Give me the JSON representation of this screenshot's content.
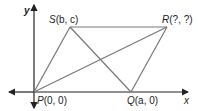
{
  "diagram": {
    "type": "coordinate-geometry-parallelogram",
    "axes": {
      "x_label": "x",
      "y_label": "y"
    },
    "points": [
      {
        "id": "P",
        "label": "P(0, 0)",
        "name": "P",
        "coords": "(0, 0)"
      },
      {
        "id": "Q",
        "label": "Q(a, 0)",
        "name": "Q",
        "coords": "(a, 0)"
      },
      {
        "id": "R",
        "label": "R(?, ?)",
        "name": "R",
        "coords": "(?, ?)"
      },
      {
        "id": "S",
        "label": "S(b, c)",
        "name": "S",
        "coords": "(b, c)"
      }
    ],
    "segments": [
      "PQ",
      "QR",
      "RS",
      "SP",
      "PR",
      "QS"
    ],
    "colors": {
      "lines": "#777777",
      "axes": "#222222",
      "text": "#222222"
    }
  }
}
